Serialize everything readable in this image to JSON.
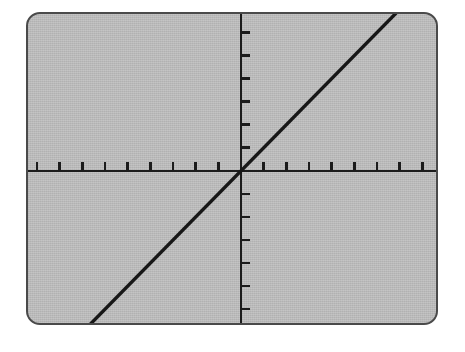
{
  "device": {
    "name": "graphing-calculator-screen",
    "screen_background_color": "#b9b9b9",
    "bezel_color": "#4a4a4a",
    "ink_color": "#1c1c1c"
  },
  "chart_data": {
    "type": "line",
    "title": "",
    "subtitle": "",
    "xlabel": "",
    "ylabel": "",
    "legend": [],
    "annotations": [],
    "grid": false,
    "axes": {
      "x_axis_visible": true,
      "y_axis_visible": true,
      "x_axis_y_value": 0,
      "y_axis_x_value": 0,
      "xlim": [
        -9.4,
        8.6
      ],
      "ylim": [
        -6.6,
        6.8
      ],
      "x_tick_step": 1,
      "y_tick_step": 1,
      "x_tick_count": 18,
      "y_tick_count": 14,
      "tick_direction_x": "up",
      "tick_direction_y": "right",
      "tick_labels_shown": false,
      "x_tick_labels": [],
      "y_tick_labels": []
    },
    "series": [
      {
        "name": "y = x",
        "equation": "y = x",
        "slope": 1,
        "intercept": 0,
        "x": [
          -8.8,
          8.3
        ],
        "values": [
          -8.8,
          8.3
        ],
        "color": "#171717",
        "passes_through_origin": true
      }
    ]
  },
  "screen": {
    "corner_radius_px": 14,
    "tick_spacing_px": 22.5,
    "origin_px": {
      "x": 211,
      "y": 160
    }
  }
}
